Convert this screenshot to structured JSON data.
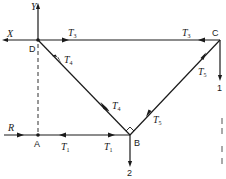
{
  "diagram": {
    "type": "free-body / truss force diagram",
    "nodes": {
      "D": "D",
      "C": "C",
      "B": "B",
      "A": "A"
    },
    "axes": {
      "y_label": "Y",
      "x_label": "X"
    },
    "external_forces": {
      "R": "R",
      "load_1": "1",
      "load_2": "2"
    },
    "members": {
      "DC": {
        "label": "T",
        "sub": "3"
      },
      "CD": {
        "label": "T",
        "sub": "3"
      },
      "DB": {
        "label": "T",
        "sub": "4"
      },
      "BD": {
        "label": "T",
        "sub": "4"
      },
      "CB": {
        "label": "T",
        "sub": "5"
      },
      "BC": {
        "label": "T",
        "sub": "5"
      },
      "AB": {
        "label": "T",
        "sub": "1"
      },
      "BA": {
        "label": "T",
        "sub": "1"
      }
    },
    "colors": {
      "ink": "#1a1a1a",
      "background": "#ffffff"
    }
  }
}
